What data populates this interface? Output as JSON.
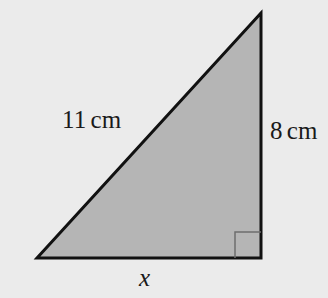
{
  "figure": {
    "name": "right-triangle-diagram",
    "background_color": "#ebebeb",
    "fill_color": "#b5b5b5",
    "stroke_color": "#111111",
    "stroke_width": 3,
    "vertices": {
      "apex": [
        261,
        13
      ],
      "bottom_left": [
        37,
        258
      ],
      "bottom_right": [
        261,
        258
      ]
    },
    "right_angle_marker": {
      "name": "right-angle-marker",
      "size": 26,
      "corner": [
        261,
        258
      ],
      "stroke_color": "#6e6e6e",
      "stroke_width": 1.5
    }
  },
  "labels": {
    "hypotenuse": {
      "value": "11",
      "unit": "cm"
    },
    "vertical_leg": {
      "value": "8",
      "unit": "cm"
    },
    "base": {
      "value": "x"
    }
  }
}
